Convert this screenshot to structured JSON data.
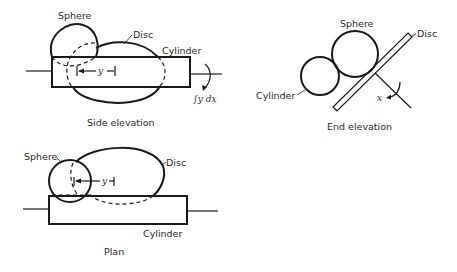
{
  "diagram": {
    "views": [
      {
        "id": "side-elevation",
        "caption": "Side elevation",
        "labels": {
          "sphere": "Sphere",
          "disc": "Disc",
          "cylinder": "Cylinder",
          "y": "y",
          "integral": "∫y dx"
        }
      },
      {
        "id": "end-elevation",
        "caption": "End elevation",
        "labels": {
          "sphere": "Sphere",
          "disc": "Disc",
          "cylinder": "Cylinder",
          "x": "x"
        }
      },
      {
        "id": "plan",
        "caption": "Plan",
        "labels": {
          "sphere": "Sphere",
          "disc": "Disc",
          "cylinder": "Cylinder",
          "y": "y"
        }
      }
    ],
    "colors": {
      "stroke": "#1a1a1a",
      "text": "#2a2a2a",
      "background": "#ffffff"
    }
  }
}
